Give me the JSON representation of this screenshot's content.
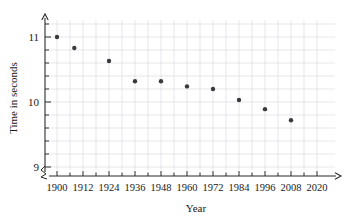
{
  "chart_data": {
    "type": "scatter",
    "title": "",
    "xlabel": "Year",
    "ylabel": "Time in seconds",
    "x": [
      1900,
      1908,
      1924,
      1936,
      1948,
      1960,
      1972,
      1984,
      1996,
      2008
    ],
    "values": [
      11.0,
      10.83,
      10.63,
      10.32,
      10.32,
      10.24,
      10.2,
      10.03,
      9.89,
      9.72
    ],
    "points": [
      {
        "year": 1900,
        "time": 11.0
      },
      {
        "year": 1908,
        "time": 10.83
      },
      {
        "year": 1924,
        "time": 10.63
      },
      {
        "year": 1936,
        "time": 10.32
      },
      {
        "year": 1948,
        "time": 10.32
      },
      {
        "year": 1960,
        "time": 10.24
      },
      {
        "year": 1972,
        "time": 10.2
      },
      {
        "year": 1984,
        "time": 10.03
      },
      {
        "year": 1996,
        "time": 9.89
      },
      {
        "year": 2008,
        "time": 9.72
      }
    ],
    "xlim": [
      1894,
      2026
    ],
    "ylim": [
      9,
      11.25
    ],
    "xticks": [
      1900,
      1912,
      1924,
      1936,
      1948,
      1960,
      1972,
      1984,
      1996,
      2008,
      2020
    ],
    "xtick_labels": [
      "1900",
      "1912",
      "1924",
      "1936",
      "1948",
      "1960",
      "1972",
      "1984",
      "1996",
      "2008",
      "2020"
    ],
    "yticks": [
      9,
      10,
      11
    ],
    "ytick_labels": [
      "9",
      "10",
      "11"
    ],
    "y_minor_step": 0.2,
    "x_minor_step": 6,
    "grid": true,
    "grid_color": "#d9dde3",
    "point_color": "#3a3a3a",
    "axis_color": "#2b2b2b",
    "legend": null,
    "axis_break_x": true,
    "axis_break_y": true
  },
  "axes": {
    "x_title": "Year",
    "y_title": "Time in seconds"
  }
}
